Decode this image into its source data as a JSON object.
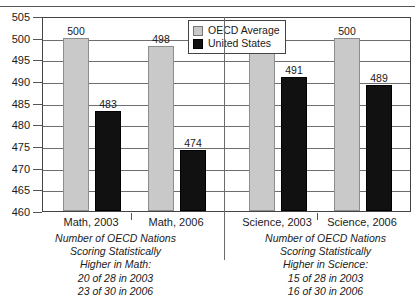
{
  "chart_data": {
    "type": "bar",
    "title": "",
    "xlabel": "",
    "ylabel": "",
    "ylim": [
      460,
      505
    ],
    "ytick_step": 5,
    "yticks": [
      460,
      465,
      470,
      475,
      480,
      485,
      490,
      495,
      500,
      505
    ],
    "grid": true,
    "legend_position": "top-center",
    "categories": [
      "Math, 2003",
      "Math, 2006",
      "Science, 2003",
      "Science, 2006"
    ],
    "series": [
      {
        "name": "OECD Average",
        "color": "#c9c9c9",
        "values": [
          500,
          498,
          500,
          500
        ]
      },
      {
        "name": "United States",
        "color": "#111111",
        "values": [
          483,
          474,
          491,
          489
        ]
      }
    ],
    "annotations": [
      "Number of OECD Nations Scoring Statistically Higher in Math: 20 of 28 in 2003, 23 of 30 in 2006",
      "Number of OECD Nations Scoring Statistically Higher in Science: 15 of 28 in 2003, 16 of 30 in 2006"
    ]
  },
  "legend": {
    "items": [
      {
        "label": "OECD Average",
        "swatch": "oecd"
      },
      {
        "label": "United States",
        "swatch": "us"
      }
    ]
  },
  "axis": {
    "y_labels": [
      "505",
      "500",
      "495",
      "490",
      "485",
      "480",
      "475",
      "470",
      "465",
      "460"
    ]
  },
  "x_labels": [
    "Math, 2003",
    "Math, 2006",
    "Science, 2003",
    "Science, 2006"
  ],
  "bar_values": {
    "math2003_oecd": "500",
    "math2003_us": "483",
    "math2006_oecd": "498",
    "math2006_us": "474",
    "science2003_oecd": "500",
    "science2003_us": "491",
    "science2006_oecd": "500",
    "science2006_us": "489"
  },
  "footnotes": {
    "math": {
      "line1": "Number of OECD Nations",
      "line2": "Scoring Statistically",
      "line3": "Higher in Math:",
      "line4": "20 of 28 in 2003",
      "line5": "23 of 30 in 2006"
    },
    "science": {
      "line1": "Number of OECD Nations",
      "line2": "Scoring Statistically",
      "line3": "Higher in Science:",
      "line4": "15 of 28 in 2003",
      "line5": "16 of 30 in 2006"
    }
  }
}
